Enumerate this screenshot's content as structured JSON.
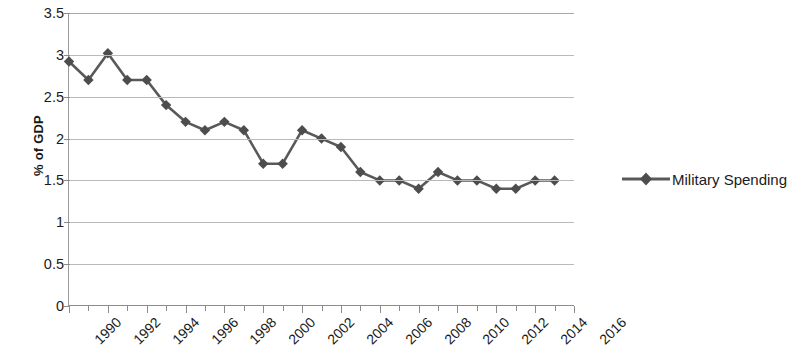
{
  "chart_data": {
    "type": "line",
    "title": "",
    "xlabel": "",
    "ylabel": "% of GDP",
    "x": [
      1990,
      1991,
      1992,
      1993,
      1994,
      1995,
      1996,
      1997,
      1998,
      1999,
      2000,
      2001,
      2002,
      2003,
      2004,
      2005,
      2006,
      2007,
      2008,
      2009,
      2010,
      2011,
      2012,
      2013,
      2014,
      2015
    ],
    "series": [
      {
        "name": "Military Spending",
        "color": "#595959",
        "marker": "diamond",
        "values": [
          2.92,
          2.7,
          3.02,
          2.7,
          2.7,
          2.4,
          2.2,
          2.1,
          2.2,
          2.1,
          1.7,
          1.7,
          2.1,
          2.0,
          1.9,
          1.6,
          1.5,
          1.5,
          1.4,
          1.6,
          1.5,
          1.5,
          1.4,
          1.4,
          1.5,
          1.5
        ]
      }
    ],
    "ylim": [
      0,
      3.5
    ],
    "ytick_labels": [
      "3.5",
      "3",
      "2.5",
      "2",
      "1.5",
      "1",
      "0.5",
      "0"
    ],
    "ytick_values": [
      3.5,
      3,
      2.5,
      2,
      1.5,
      1,
      0.5,
      0
    ],
    "xtick_labels": [
      "1990",
      "1992",
      "1994",
      "1996",
      "1998",
      "2000",
      "2002",
      "2004",
      "2006",
      "2008",
      "2010",
      "2012",
      "2014",
      "2016"
    ],
    "xtick_values": [
      1990,
      1992,
      1994,
      1996,
      1998,
      2000,
      2002,
      2004,
      2006,
      2008,
      2010,
      2012,
      2014,
      2016
    ],
    "xlim": [
      1990,
      2016
    ],
    "grid": "horizontal",
    "legend_position": "right",
    "legend_entries": [
      "Military Spending"
    ],
    "plot_background": "#ffffff",
    "gridline_color": "#b9b9b9",
    "axis_color": "#8c8c8c"
  }
}
